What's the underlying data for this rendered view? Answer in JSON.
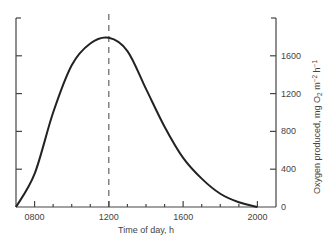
{
  "chart_data": {
    "type": "line",
    "title": "",
    "xlabel": "Time of day, h",
    "ylabel": "Oxygen produced, mg O2 m-2 h-1",
    "ylabel_parts": {
      "main": "Oxygen produced, mg O",
      "sub": "2",
      "mid": " m",
      "sup1": "−2",
      "end": " h",
      "sup2": "−1"
    },
    "xlim": [
      700,
      2100
    ],
    "ylim": [
      0,
      2000
    ],
    "x_ticks": [
      "0800",
      "1200",
      "1600",
      "2000"
    ],
    "x_tick_values": [
      800,
      1200,
      1600,
      2000
    ],
    "y_ticks": [
      "0",
      "400",
      "800",
      "1200",
      "1600"
    ],
    "y_tick_values": [
      0,
      400,
      800,
      1200,
      1600
    ],
    "y_axis_position": "right",
    "grid": false,
    "annotations": [
      {
        "type": "vertical-dashed-line",
        "x": 1200
      }
    ],
    "series": [
      {
        "name": "Oxygen production",
        "x": [
          700,
          800,
          900,
          1000,
          1100,
          1200,
          1300,
          1400,
          1500,
          1600,
          1700,
          1800,
          1900,
          2000
        ],
        "values": [
          0,
          350,
          1000,
          1500,
          1730,
          1790,
          1650,
          1250,
          850,
          520,
          300,
          140,
          50,
          0
        ]
      }
    ]
  }
}
